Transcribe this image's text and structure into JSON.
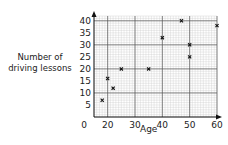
{
  "chart_data": {
    "type": "scatter",
    "title": "",
    "xlabel": "Age",
    "ylabel": "Number of driving lessons",
    "ylabel_lines": [
      "Number of",
      "driving lessons"
    ],
    "xlim": [
      0,
      60
    ],
    "ylim": [
      0,
      40
    ],
    "x_ticks": [
      0,
      20,
      30,
      40,
      50,
      60
    ],
    "y_ticks": [
      5,
      10,
      15,
      20,
      25,
      30,
      35,
      40
    ],
    "grid": true,
    "marker": "x",
    "points": [
      {
        "x": 18,
        "y": 7
      },
      {
        "x": 20,
        "y": 16
      },
      {
        "x": 22,
        "y": 12
      },
      {
        "x": 25,
        "y": 20
      },
      {
        "x": 35,
        "y": 20
      },
      {
        "x": 40,
        "y": 33
      },
      {
        "x": 47,
        "y": 40
      },
      {
        "x": 50,
        "y": 30
      },
      {
        "x": 50,
        "y": 25
      },
      {
        "x": 60,
        "y": 38
      }
    ]
  },
  "colors": {
    "major_grid": "#555555",
    "minor_grid": "#c8c8c8",
    "axis": "#111111",
    "marker": "#111111"
  }
}
